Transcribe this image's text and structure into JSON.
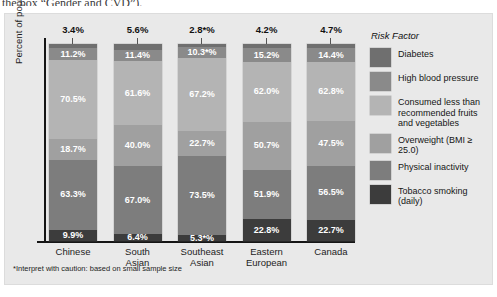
{
  "document_fragment": "the box “Gender and CVD”).",
  "chart_data": {
    "type": "bar",
    "subtype": "stacked-bar",
    "title": "",
    "xlabel": "",
    "ylabel": "Percent of population with risk factor",
    "ylim": [
      0,
      100
    ],
    "grid": false,
    "legend_position": "right",
    "legend_title": "Risk Factor",
    "categories": [
      "Chinese",
      "South Asian",
      "Southeast Asian",
      "Eastern European",
      "Canada"
    ],
    "category_lines": [
      [
        "Chinese"
      ],
      [
        "South",
        "Asian"
      ],
      [
        "Southeast",
        "Asian"
      ],
      [
        "Eastern",
        "European"
      ],
      [
        "Canada"
      ]
    ],
    "series": [
      {
        "name": "Diabetes",
        "color": "#6f6f6f",
        "values": [
          3.4,
          5.6,
          2.8,
          4.2,
          4.7
        ],
        "labels": [
          "3.4%",
          "5.6%",
          "2.8*%",
          "4.2%",
          "4.7%"
        ],
        "label_position": "above-bar"
      },
      {
        "name": "High blood pressure",
        "color": "#8a8a8a",
        "values": [
          11.2,
          11.4,
          10.3,
          15.2,
          14.4
        ],
        "labels": [
          "11.2%",
          "11.4%",
          "10.3*%",
          "15.2%",
          "14.4%"
        ]
      },
      {
        "name": "Consumed less than recommended fruits and vegetables",
        "color": "#b4b4b4",
        "values": [
          70.5,
          61.6,
          67.2,
          62.0,
          62.8
        ],
        "labels": [
          "70.5%",
          "61.6%",
          "67.2%",
          "62.0%",
          "62.8%"
        ]
      },
      {
        "name": "Overweight (BMI ≥ 25.0)",
        "color": "#a0a0a0",
        "values": [
          18.7,
          40.0,
          22.7,
          50.7,
          47.5
        ],
        "labels": [
          "18.7%",
          "40.0%",
          "22.7%",
          "50.7%",
          "47.5%"
        ]
      },
      {
        "name": "Physical inactivity",
        "color": "#7d7d7d",
        "values": [
          63.3,
          67.0,
          73.5,
          51.9,
          56.5
        ],
        "labels": [
          "63.3%",
          "67.0%",
          "73.5%",
          "51.9%",
          "56.5%"
        ]
      },
      {
        "name": "Tobacco smoking (daily)",
        "color": "#3c3c3c",
        "values": [
          9.9,
          6.4,
          5.3,
          22.8,
          22.7
        ],
        "labels": [
          "9.9%",
          "6.4%",
          "5.3*%",
          "22.8%",
          "22.7%"
        ]
      }
    ]
  },
  "legend": {
    "title": "Risk Factor",
    "items": [
      {
        "label": "Diabetes",
        "color": "#6f6f6f"
      },
      {
        "label": "High blood pressure",
        "color": "#8a8a8a"
      },
      {
        "label": "Consumed less than recommended fruits and vegetables",
        "color": "#b4b4b4"
      },
      {
        "label": "Overweight (BMI ≥ 25.0)",
        "color": "#a0a0a0"
      },
      {
        "label": "Physical inactivity",
        "color": "#7d7d7d"
      },
      {
        "label": "Tobacco smoking (daily)",
        "color": "#3c3c3c"
      }
    ]
  },
  "footnote": "*Interpret with caution: based on small sample size"
}
